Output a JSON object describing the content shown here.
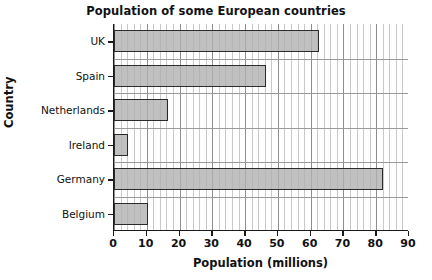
{
  "chart_data": {
    "type": "bar",
    "orientation": "horizontal",
    "title": "Population of some European countries",
    "xlabel": "Population (millions)",
    "ylabel": "Country",
    "categories": [
      "UK",
      "Spain",
      "Netherlands",
      "Ireland",
      "Germany",
      "Belgium"
    ],
    "values": [
      62.5,
      46.5,
      16.5,
      4.3,
      82,
      10.5
    ],
    "xlim": [
      0,
      90
    ],
    "xticks": [
      0,
      10,
      20,
      30,
      40,
      50,
      60,
      70,
      80,
      90
    ],
    "xtick_labels": [
      "0",
      "10",
      "20",
      "30",
      "40",
      "50",
      "60",
      "70",
      "80",
      "90"
    ],
    "minor_tick_step": 2,
    "grid": "both",
    "legend": "none",
    "bar_fill_color": "#b0b0b0",
    "bar_edge_color": "#2b2b2b",
    "major_gridline_color": "#8e8e8e",
    "minor_gridline_color": "#c9c9c9",
    "axis_color": "#1a1a1a",
    "background_color": "#ffffff",
    "text_color": "#111111"
  }
}
